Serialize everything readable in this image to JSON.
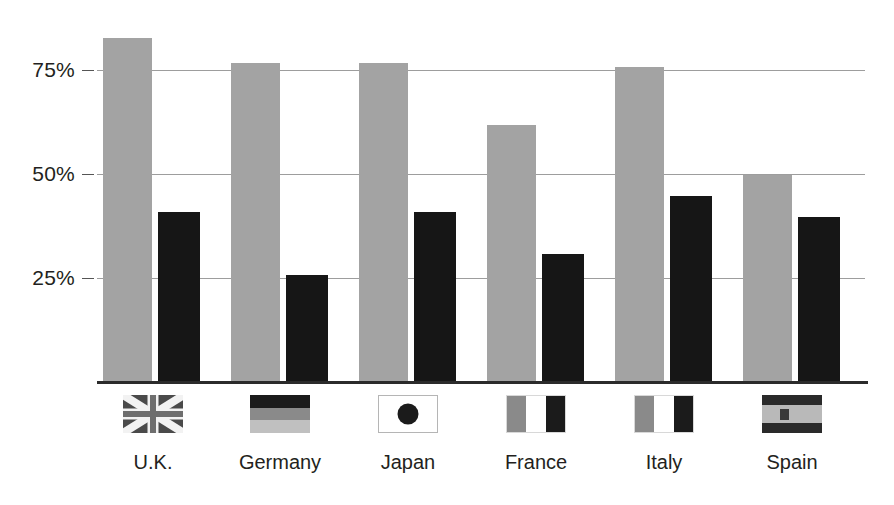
{
  "chart_data": {
    "type": "bar",
    "title": "",
    "subtitle": "",
    "xlabel": "",
    "ylabel": "",
    "categories": [
      "U.K.",
      "Germany",
      "Japan",
      "France",
      "Italy",
      "Spain"
    ],
    "series": [
      {
        "name": "light-gray-series",
        "color": "#a3a3a3",
        "values": [
          83,
          77,
          77,
          62,
          76,
          50
        ]
      },
      {
        "name": "black-series",
        "color": "#161616",
        "values": [
          41,
          26,
          41,
          31,
          45,
          40
        ]
      }
    ],
    "ylim": [
      0,
      90
    ],
    "yticks": [
      25,
      50,
      75
    ],
    "ytick_labels": [
      "25%",
      "50%",
      "75%"
    ],
    "grid": true,
    "legend_position": "below-axis-flags"
  },
  "axis": {
    "y_ticks": [
      {
        "label": "75%",
        "value": 75
      },
      {
        "label": "50%",
        "value": 50
      },
      {
        "label": "25%",
        "value": 25
      }
    ]
  },
  "legend": {
    "items": [
      {
        "country": "U.K.",
        "flag": "flag-united-kingdom"
      },
      {
        "country": "Germany",
        "flag": "flag-germany"
      },
      {
        "country": "Japan",
        "flag": "flag-japan"
      },
      {
        "country": "France",
        "flag": "flag-france"
      },
      {
        "country": "Italy",
        "flag": "flag-italy"
      },
      {
        "country": "Spain",
        "flag": "flag-spain"
      }
    ]
  },
  "colors": {
    "light_bar": "#a3a3a3",
    "dark_bar": "#161616",
    "gridline": "#9d9d9d",
    "baseline": "#2b2b2b",
    "text": "#231f20",
    "background": "#ffffff"
  }
}
